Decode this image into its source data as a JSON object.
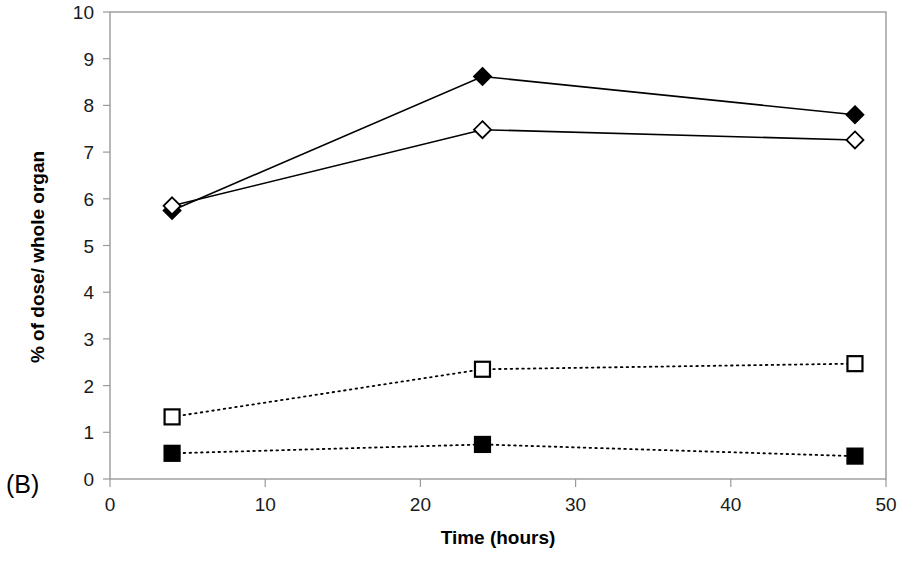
{
  "figure": {
    "panel_label": "(B)"
  },
  "chart_data": {
    "type": "line",
    "title": "",
    "subtitle": "",
    "xlabel": "Time (hours)",
    "ylabel": "% of dose/ whole organ",
    "x": [
      4,
      24,
      48
    ],
    "xlim": [
      0,
      50
    ],
    "ylim": [
      0,
      10
    ],
    "xticks": [
      0,
      10,
      20,
      30,
      40,
      50
    ],
    "yticks": [
      0,
      1,
      2,
      3,
      4,
      5,
      6,
      7,
      8,
      9,
      10
    ],
    "xtick_labels": [
      "0",
      "10",
      "20",
      "30",
      "40",
      "50"
    ],
    "ytick_labels": [
      "0",
      "1",
      "2",
      "3",
      "4",
      "5",
      "6",
      "7",
      "8",
      "9",
      "10"
    ],
    "grid": false,
    "legend": "none",
    "series": [
      {
        "name": "filled-diamond",
        "marker": "diamond-filled",
        "linestyle": "solid",
        "color": "#000000",
        "values": [
          5.75,
          8.62,
          7.8
        ]
      },
      {
        "name": "open-diamond",
        "marker": "diamond-open",
        "linestyle": "solid",
        "color": "#000000",
        "values": [
          5.85,
          7.48,
          7.26
        ]
      },
      {
        "name": "open-square",
        "marker": "square-open",
        "linestyle": "dotted",
        "color": "#000000",
        "values": [
          1.33,
          2.35,
          2.47
        ]
      },
      {
        "name": "filled-square",
        "marker": "square-filled",
        "linestyle": "dotted",
        "color": "#000000",
        "values": [
          0.55,
          0.74,
          0.49
        ]
      }
    ]
  }
}
